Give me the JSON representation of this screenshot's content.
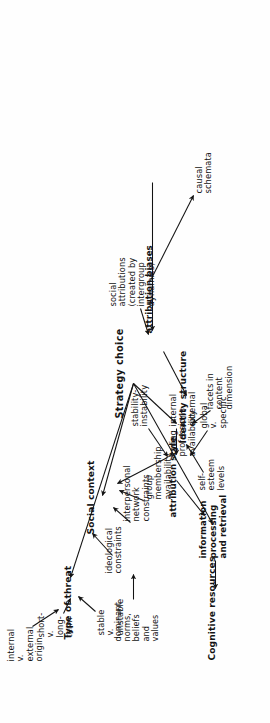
{
  "figure": {
    "type": "hierarchy-tree-diagram",
    "orientation": "rotated-90-ccw",
    "root": "Strategy choice",
    "ink_color": "#131313",
    "paper_color": "#fefefe"
  },
  "nodes": {
    "root": "Strategy choice",
    "type_of_threat": "Type of threat",
    "threat_internal_external": "internal\nv.\nexternal\norigin",
    "threat_short_long": "short-\nv.\nlong-\nterm",
    "threat_stable_unstable": "stable\nv.\nunstable",
    "social_context": "Social context",
    "ideological_constraints": "ideological\nconstraints",
    "dominant_norms": "dominant\nnorms,\nbeliefs\nand\nvalues",
    "interpersonal_network": "interpersonal\nnetwork\nconstraints",
    "group_membership": "group\nmembership\navailability",
    "caring_professions": "caring\nprofessions\navailability",
    "identity_structure": "Identity structure",
    "self_esteem_levels": "self-\nesteem\nlevels",
    "facets_in_content": "facets in\ncontent\ndimension",
    "cognitive_resources": "Cognitive resources",
    "information_processing": "information\nprocessing\nand retrieval",
    "attribution_style": "attribution style",
    "global_specific": "global\nv.\nspecific",
    "internal_external": "internal\nv.\nexternal",
    "stability_instability": "stability-\ninstability",
    "attribution_biases": "attribution biases",
    "social_attributions": "social\nattributions\n(created by\nintergroup\ndynamics)",
    "causal_schemata": "causal\nschemata"
  },
  "edges": [
    {
      "from": "Strategy choice",
      "to": "Type of threat"
    },
    {
      "from": "Strategy choice",
      "to": "Social context"
    },
    {
      "from": "Strategy choice",
      "to": "Identity structure"
    },
    {
      "from": "Strategy choice",
      "to": "Cognitive resources"
    },
    {
      "from": "internal v. external origin",
      "to": "Type of threat"
    },
    {
      "from": "short- v. long-term",
      "to": "Type of threat"
    },
    {
      "from": "stable v. unstable",
      "to": "Type of threat"
    },
    {
      "from": "ideological constraints",
      "to": "Social context"
    },
    {
      "from": "dominant norms, beliefs and values",
      "to": "ideological constraints"
    },
    {
      "from": "interpersonal network constraints",
      "to": "Social context"
    },
    {
      "from": "group membership availability",
      "to": "Social context"
    },
    {
      "from": "caring professions availability",
      "to": "Social context"
    },
    {
      "from": "self-esteem levels",
      "to": "Identity structure"
    },
    {
      "from": "facets in content dimension",
      "to": "Identity structure"
    },
    {
      "from": "information processing and retrieval",
      "to": "Cognitive resources"
    },
    {
      "from": "attribution style",
      "to": "information processing and retrieval"
    },
    {
      "from": "global v. specific",
      "to": "attribution style"
    },
    {
      "from": "internal v. external",
      "to": "attribution style"
    },
    {
      "from": "stability-instability",
      "to": "attribution style"
    },
    {
      "from": "attribution biases",
      "to": "information processing and retrieval"
    },
    {
      "from": "social attributions (created by intergroup dynamics)",
      "to": "attribution biases"
    },
    {
      "from": "causal schemata",
      "to": "attribution biases"
    },
    {
      "from": "social attributions (created by intergroup dynamics)",
      "to": "causal schemata"
    }
  ]
}
